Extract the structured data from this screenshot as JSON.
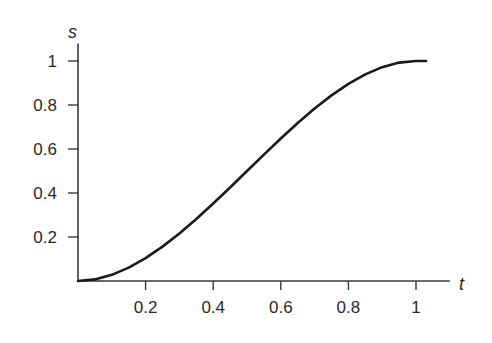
{
  "chart_data": {
    "type": "line",
    "title": "",
    "xlabel": "t",
    "ylabel": "s",
    "xlim": [
      0,
      1.1
    ],
    "ylim": [
      0,
      1.08
    ],
    "xticks": [
      0.2,
      0.4,
      0.6,
      0.8,
      1
    ],
    "xtick_labels": [
      "0.2",
      "0.4",
      "0.6",
      "0.8",
      "1"
    ],
    "yticks": [
      0.2,
      0.4,
      0.6,
      0.8,
      1
    ],
    "ytick_labels": [
      "0.2",
      "0.4",
      "0.6",
      "0.8",
      "1"
    ],
    "grid": false,
    "legend": null,
    "series": [
      {
        "name": "s(t)",
        "color": "#1a1a1a",
        "x": [
          0,
          0.05,
          0.1,
          0.15,
          0.2,
          0.25,
          0.3,
          0.35,
          0.4,
          0.45,
          0.5,
          0.55,
          0.6,
          0.65,
          0.7,
          0.75,
          0.8,
          0.85,
          0.9,
          0.95,
          1.0,
          1.03
        ],
        "y": [
          0,
          0.00725,
          0.028,
          0.06075,
          0.104,
          0.15625,
          0.216,
          0.28175,
          0.352,
          0.42525,
          0.5,
          0.57475,
          0.648,
          0.71825,
          0.784,
          0.84375,
          0.896,
          0.93925,
          0.972,
          0.99275,
          1.0,
          1.0
        ]
      }
    ]
  }
}
